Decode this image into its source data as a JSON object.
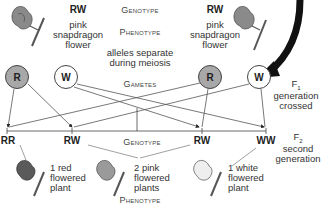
{
  "parents": {
    "left": {
      "genotype": "RW",
      "phenotype_lines": [
        "pink",
        "snapdragon",
        "flower"
      ]
    },
    "right": {
      "genotype": "RW",
      "phenotype_lines": [
        "pink",
        "snapdragon",
        "flower"
      ]
    }
  },
  "center_labels": {
    "genotype": "Genotype",
    "phenotype": "Phenotype",
    "meiosis_line1": "alleles separate",
    "meiosis_line2": "during meiosis",
    "gametes": "Gametes"
  },
  "gametes": [
    {
      "allele": "R",
      "fill": "#a8a8a8"
    },
    {
      "allele": "W",
      "fill": "#ffffff"
    },
    {
      "allele": "R",
      "fill": "#a8a8a8"
    },
    {
      "allele": "W",
      "fill": "#ffffff"
    }
  ],
  "f1": {
    "label": "F",
    "sub": "1",
    "line1": "generation",
    "line2": "crossed"
  },
  "f2": {
    "label": "F",
    "sub": "2",
    "line1": "second",
    "line2": "generation"
  },
  "offspring": {
    "genotype_label": "Genotype",
    "phenotype_label": "Phenotype",
    "genotypes": [
      "RR",
      "RW",
      "RW",
      "WW"
    ],
    "phenotypes": [
      {
        "lines": [
          "1 red",
          "flowered",
          "plant"
        ],
        "color": "#6a6a6a"
      },
      {
        "lines": [
          "2 pink",
          "flowered",
          "plants"
        ],
        "color": "#9a9a9a"
      },
      {
        "lines": [
          "1 white",
          "flowered",
          "plant"
        ],
        "color": "#e8e8e8"
      }
    ]
  },
  "colors": {
    "dominant_allele": "#a8a8a8",
    "recessive_allele": "#ffffff",
    "line": "#555555",
    "arrow": "#111111"
  }
}
